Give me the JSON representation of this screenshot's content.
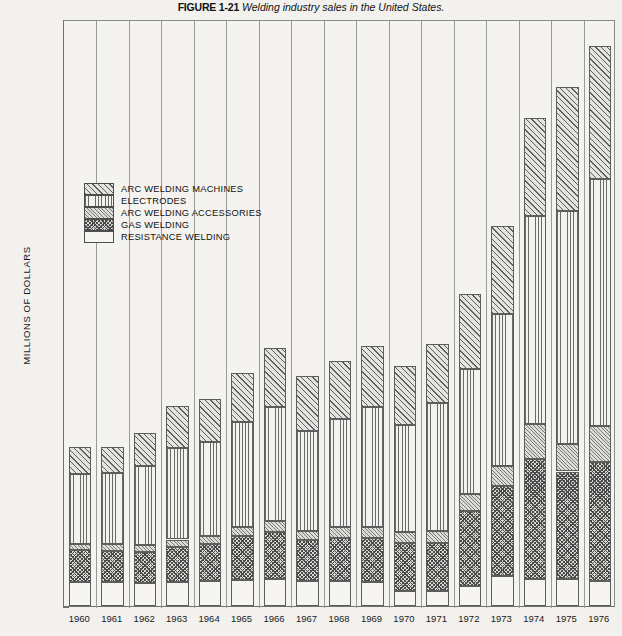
{
  "caption": {
    "figure_number": "FIGURE 1-21",
    "text": "Welding industry sales in the United States."
  },
  "legend": {
    "items": [
      {
        "label": "ARC WELDING MACHINES",
        "pattern": "diagonal-hatch-wide",
        "key": "machines"
      },
      {
        "label": "ELECTRODES",
        "pattern": "vertical-lines",
        "key": "electrodes"
      },
      {
        "label": "ARC WELDING ACCESSORIES",
        "pattern": "diagonal-hatch-fine",
        "key": "accessories"
      },
      {
        "label": "GAS WELDING",
        "pattern": "crosshatch-dense",
        "key": "gas"
      },
      {
        "label": "RESISTANCE WELDING",
        "pattern": "solid-white",
        "key": "resistance"
      }
    ]
  },
  "axes": {
    "y_label": "MILLIONS OF DOLLARS",
    "y_ticks": [
      0,
      100,
      200,
      300,
      400,
      500,
      600,
      700,
      800,
      900,
      1000,
      1100,
      1200
    ],
    "y_min": 0,
    "y_max": 1200,
    "x_label": "",
    "x_ticks": [
      "1960",
      "1961",
      "1962",
      "1963",
      "1964",
      "1965",
      "1966",
      "1967",
      "1968",
      "1969",
      "1970",
      "1971",
      "1972",
      "1973",
      "1974",
      "1975",
      "1976"
    ]
  },
  "chart_data": {
    "type": "bar",
    "stacked": true,
    "title": "Welding industry sales in the United States.",
    "xlabel": "",
    "ylabel": "MILLIONS OF DOLLARS",
    "ylim": [
      0,
      1200
    ],
    "grid": false,
    "legend_position": "upper-left-inside",
    "categories": [
      "1960",
      "1961",
      "1962",
      "1963",
      "1964",
      "1965",
      "1966",
      "1967",
      "1968",
      "1969",
      "1970",
      "1971",
      "1972",
      "1973",
      "1974",
      "1975",
      "1976"
    ],
    "series": [
      {
        "name": "RESISTANCE WELDING",
        "values": [
          49,
          49,
          48,
          50,
          52,
          54,
          55,
          52,
          52,
          50,
          30,
          30,
          40,
          62,
          55,
          55,
          52
        ]
      },
      {
        "name": "GAS WELDING",
        "values": [
          65,
          63,
          62,
          70,
          75,
          90,
          97,
          82,
          88,
          90,
          98,
          98,
          155,
          183,
          245,
          220,
          243
        ]
      },
      {
        "name": "ARC WELDING ACCESSORIES",
        "values": [
          13,
          14,
          14,
          16,
          17,
          18,
          22,
          20,
          22,
          22,
          24,
          25,
          35,
          42,
          72,
          57,
          72
        ]
      },
      {
        "name": "ELECTRODES",
        "values": [
          143,
          145,
          162,
          188,
          192,
          215,
          232,
          204,
          220,
          245,
          218,
          262,
          255,
          310,
          425,
          475,
          505
        ]
      },
      {
        "name": "ARC WELDING MACHINES",
        "values": [
          55,
          55,
          68,
          85,
          88,
          100,
          122,
          112,
          118,
          125,
          120,
          120,
          153,
          180,
          200,
          255,
          273
        ]
      }
    ],
    "totals": [
      325,
      326,
      354,
      409,
      424,
      477,
      528,
      470,
      500,
      532,
      490,
      535,
      638,
      777,
      997,
      1062,
      1145
    ]
  }
}
